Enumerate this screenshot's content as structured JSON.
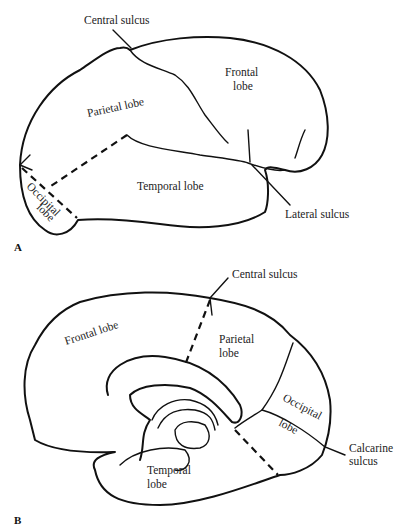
{
  "panels": [
    {
      "id": "A",
      "label": "A",
      "view": "lateral",
      "labels": {
        "central_sulcus": "Central sulcus",
        "frontal_1": "Frontal",
        "frontal_2": "lobe",
        "parietal": "Parietal lobe",
        "temporal": "Temporal lobe",
        "occipital_1": "Occipital",
        "occipital_2": "lobe",
        "lateral_sulcus": "Lateral sulcus"
      }
    },
    {
      "id": "B",
      "label": "B",
      "view": "medial",
      "labels": {
        "central_sulcus": "Central sulcus",
        "frontal": "Frontal lobe",
        "parietal_1": "Parietal",
        "parietal_2": "lobe",
        "occipital_1": "Occipital",
        "occipital_2": "lobe",
        "calcarine_1": "Calcarine",
        "calcarine_2": "sulcus",
        "temporal_1": "Temporal",
        "temporal_2": "lobe"
      }
    }
  ],
  "colors": {
    "line": "#111111",
    "background": "#ffffff"
  }
}
